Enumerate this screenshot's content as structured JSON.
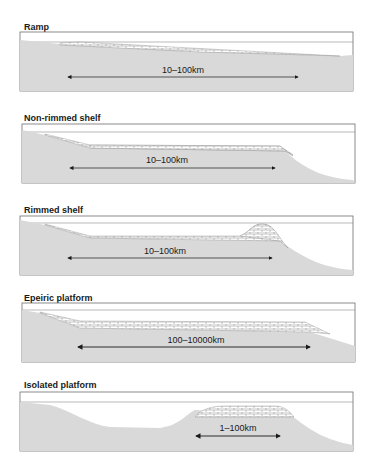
{
  "figure": {
    "panels": [
      {
        "id": "ramp",
        "title": "Ramp",
        "dimension_label": "10–100km"
      },
      {
        "id": "non-rimmed-shelf",
        "title": "Non-rimmed shelf",
        "dimension_label": "10–100km"
      },
      {
        "id": "rimmed-shelf",
        "title": "Rimmed shelf",
        "dimension_label": "10–100km"
      },
      {
        "id": "epeiric-platform",
        "title": "Epeiric platform",
        "dimension_label": "100–10000km"
      },
      {
        "id": "isolated-platform",
        "title": "Isolated platform",
        "dimension_label": "1–100km"
      }
    ],
    "colors": {
      "seafloor_fill": "#d9d9d9",
      "frame": "#6e6e6e",
      "sea_level_line": "#8a8a8a",
      "carbonate_fill": "#ffffff",
      "carbonate_lines": "#8a8a8a",
      "arrow": "#1a1a1a"
    }
  }
}
